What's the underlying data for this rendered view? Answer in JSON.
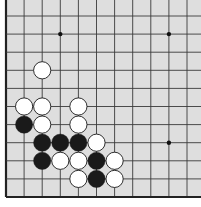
{
  "board": {
    "background": "#dedede",
    "line_color": "#3a3a3a",
    "edge_color": "#222222",
    "columns": 11,
    "rows": 11,
    "edges": [
      "left",
      "bottom"
    ],
    "star_points": [
      [
        3,
        1
      ],
      [
        9,
        1
      ],
      [
        9,
        7
      ]
    ],
    "stones": [
      {
        "color": "white",
        "col": 2,
        "row": 3
      },
      {
        "color": "white",
        "col": 1,
        "row": 5
      },
      {
        "color": "white",
        "col": 2,
        "row": 5
      },
      {
        "color": "white",
        "col": 4,
        "row": 5
      },
      {
        "color": "black",
        "col": 1,
        "row": 6
      },
      {
        "color": "white",
        "col": 2,
        "row": 6
      },
      {
        "color": "white",
        "col": 4,
        "row": 6
      },
      {
        "color": "black",
        "col": 2,
        "row": 7
      },
      {
        "color": "black",
        "col": 3,
        "row": 7
      },
      {
        "color": "black",
        "col": 4,
        "row": 7
      },
      {
        "color": "white",
        "col": 5,
        "row": 7
      },
      {
        "color": "black",
        "col": 2,
        "row": 8
      },
      {
        "color": "white",
        "col": 3,
        "row": 8
      },
      {
        "color": "white",
        "col": 4,
        "row": 8
      },
      {
        "color": "black",
        "col": 5,
        "row": 8
      },
      {
        "color": "white",
        "col": 6,
        "row": 8
      },
      {
        "color": "white",
        "col": 4,
        "row": 9
      },
      {
        "color": "black",
        "col": 5,
        "row": 9
      },
      {
        "color": "white",
        "col": 6,
        "row": 9
      }
    ]
  }
}
